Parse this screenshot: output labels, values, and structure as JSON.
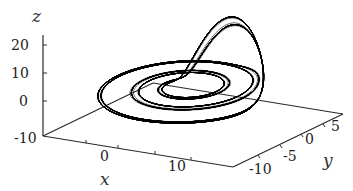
{
  "chart_data": {
    "type": "line3d",
    "title": "",
    "axes": {
      "x": {
        "label": "x",
        "ticks": [
          0,
          10
        ],
        "tick_labels": [
          "0",
          "10"
        ],
        "range": [
          -10,
          15
        ]
      },
      "y": {
        "label": "y",
        "ticks": [
          -10,
          -5,
          0,
          5
        ],
        "tick_labels": [
          "-10",
          "-5",
          "0",
          "5"
        ],
        "range": [
          -12,
          7
        ]
      },
      "z": {
        "label": "z",
        "ticks": [
          -10,
          0,
          10,
          20
        ],
        "tick_labels": [
          "-10",
          "0",
          "10",
          "20"
        ],
        "range": [
          -10,
          25
        ]
      }
    },
    "series": [
      {
        "name": "trajectory",
        "color": "#000000",
        "style": "line"
      }
    ],
    "grid": false,
    "legend": null
  },
  "labels": {
    "x_axis": "x",
    "y_axis": "y",
    "z_axis": "z",
    "z_ticks": [
      "20",
      "10",
      "0",
      "-10"
    ],
    "x_ticks": [
      "0",
      "10"
    ],
    "y_ticks": [
      "-10",
      "-5",
      "0",
      "5"
    ]
  }
}
